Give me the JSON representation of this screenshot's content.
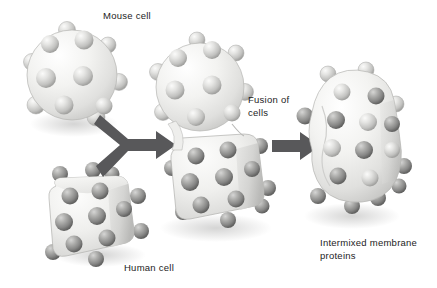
{
  "figure": {
    "background_color": "#ffffff"
  },
  "labels": {
    "mouse_cell": "Mouse cell",
    "human_cell": "Human cell",
    "fusion_of_cells": "Fusion of\ncells",
    "intermixed_membrane_proteins": "Intermixed membrane\nproteins"
  },
  "colors": {
    "membrane_light": "#f2f2f0",
    "membrane_mid": "#dcdcda",
    "membrane_shadow": "#bdbdbb",
    "protein_light": "#d8d8d6",
    "protein_light_dark": "#a5a5a3",
    "protein_dark": "#9a9a99",
    "protein_dark_shade": "#6e6e6d",
    "arrow": "#58585a",
    "outline": "#8f8f8e",
    "text": "#1c1c1c"
  },
  "stages": [
    {
      "name": "mouse-cell",
      "shape": "sphere",
      "protein_type": "light",
      "protein_count": 11,
      "center": {
        "x": 70,
        "y": 78
      },
      "radius": 47
    },
    {
      "name": "human-cell",
      "shape": "rounded-cube",
      "protein_type": "dark",
      "protein_count": 12,
      "center": {
        "x": 95,
        "y": 212
      },
      "width": 92,
      "height": 82
    },
    {
      "name": "fused-cell",
      "shape": "sphere-plus-cube",
      "protein_type": "segregated",
      "protein_count_light": 11,
      "protein_count_dark": 12,
      "center": {
        "x": 213,
        "y": 140
      }
    },
    {
      "name": "intermixed-cell",
      "shape": "irregular-blob",
      "protein_type": "mixed",
      "protein_count_light": 9,
      "protein_count_dark": 10,
      "center": {
        "x": 350,
        "y": 150
      }
    }
  ],
  "arrows": [
    {
      "name": "fusion-arrow",
      "style": "two-tails-merging",
      "from": [
        "mouse-cell",
        "human-cell"
      ],
      "to": "fused-cell"
    },
    {
      "name": "intermix-arrow",
      "style": "straight",
      "from": "fused-cell",
      "to": "intermixed-cell"
    }
  ]
}
